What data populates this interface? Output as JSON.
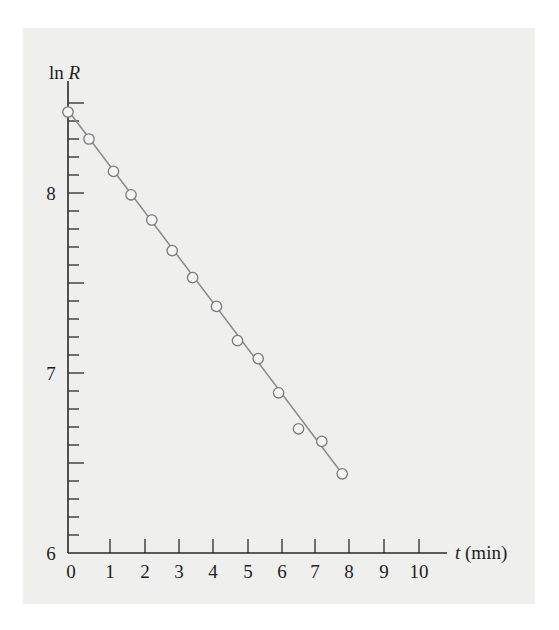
{
  "chart_data": {
    "type": "scatter",
    "title": "",
    "xlabel": "t (min)",
    "xlabel_var": "t",
    "xlabel_unit": "(min)",
    "ylabel": "ln R",
    "ylabel_fn": "ln",
    "ylabel_var": "R",
    "xlim": [
      0,
      10.8
    ],
    "ylim": [
      6,
      8.6
    ],
    "x_ticks": [
      0,
      1,
      2,
      3,
      4,
      5,
      6,
      7,
      8,
      9,
      10
    ],
    "x_tick_labels": [
      "0",
      "1",
      "2",
      "3",
      "4",
      "5",
      "6",
      "7",
      "8",
      "9",
      "10"
    ],
    "y_ticks_major": [
      6,
      7,
      8
    ],
    "y_tick_labels": [
      "6",
      "7",
      "8"
    ],
    "y_minor_step": 0.1,
    "grid": false,
    "legend": null,
    "series": [
      {
        "name": "ln R data",
        "marker": "open-circle",
        "x": [
          0,
          0.5,
          1.1,
          1.6,
          2.2,
          2.8,
          3.4,
          4.1,
          4.7,
          5.3,
          5.9,
          6.5,
          7.2,
          7.8
        ],
        "y": [
          8.45,
          8.3,
          8.12,
          7.99,
          7.85,
          7.68,
          7.53,
          7.37,
          7.18,
          7.08,
          6.89,
          6.69,
          6.62,
          6.44
        ]
      }
    ],
    "fit_line": {
      "x": [
        0,
        7.8
      ],
      "y": [
        8.46,
        6.44
      ],
      "style": "solid"
    }
  },
  "colors": {
    "panel_bg": "#efefee",
    "axis": "#2a2a2a",
    "line": "#8a8a8a",
    "marker_stroke": "#7a7a7a",
    "marker_fill": "#f4f4f4",
    "text": "#1e1e1e"
  }
}
